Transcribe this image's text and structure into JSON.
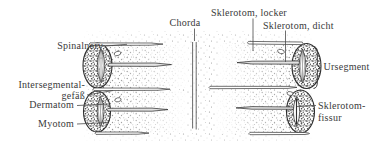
{
  "labels": {
    "chorda": "Chorda",
    "sklerotom_locker": "Sklerotom, locker",
    "sklerotom_dicht": "Sklerotom, dicht",
    "spinalnerv": "Spinalnerv",
    "intersegmental_line1": "Intersegmental-",
    "intersegmental_line2": "gefäß",
    "dermatom": "Dermatom",
    "myotom": "Myotom",
    "ursegment": "Ursegment",
    "sklerotomfissur_line1": "Sklerotom-",
    "sklerotomfissur_line2": "fissur"
  },
  "colors": {
    "ink": "#3a3a3a",
    "outline": "#2f2f2f",
    "leader": "#4a4a4a",
    "background": "#ffffff",
    "stipple": "#8c8c8c"
  }
}
